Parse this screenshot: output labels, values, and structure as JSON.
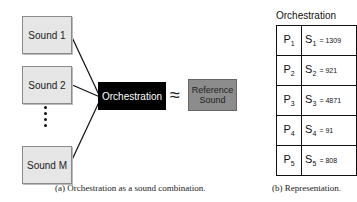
{
  "diagram_a": {
    "sounds": [
      {
        "label": "Sound 1"
      },
      {
        "label": "Sound 2"
      },
      {
        "label": "Sound M"
      }
    ],
    "ellipsis": "⋮",
    "orchestration_label": "Orchestration",
    "approx_symbol": "≈",
    "reference_label_line1": "Reference",
    "reference_label_line2": "Sound",
    "caption": "(a) Orchestration as a sound combination."
  },
  "diagram_b": {
    "title": "Orchestration",
    "rows": [
      {
        "p": "P",
        "p_sub": "1",
        "s": "S",
        "s_sub": "1",
        "value": "= 1309"
      },
      {
        "p": "P",
        "p_sub": "2",
        "s": "S",
        "s_sub": "2",
        "value": "= 921"
      },
      {
        "p": "P",
        "p_sub": "3",
        "s": "S",
        "s_sub": "3",
        "value": "= 4871"
      },
      {
        "p": "P",
        "p_sub": "4",
        "s": "S",
        "s_sub": "4",
        "value": "= 91"
      },
      {
        "p": "P",
        "p_sub": "5",
        "s": "S",
        "s_sub": "5",
        "value": "= 808"
      }
    ],
    "caption": "(b) Representation."
  },
  "colors": {
    "sound_box": "#e6e6e6",
    "orchestration_box": "#000000",
    "reference_box": "#8c8c8c"
  }
}
